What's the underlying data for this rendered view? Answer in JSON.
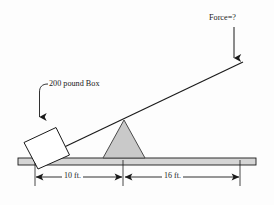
{
  "diagram": {
    "background_color": "#fdfdfd",
    "stroke_color": "#1a1a1a",
    "fill_gray": "#c9c9c9",
    "ground_fill": "#d5d5d5",
    "labels": {
      "force": "Force=?",
      "box": "200 pound Box",
      "distance_left": "10 ft.",
      "distance_right": "16 ft."
    },
    "elements": {
      "lever_label": "lever-arm",
      "fulcrum_label": "fulcrum-triangle",
      "ground_label": "ground-bar",
      "box_label": "weight-box",
      "force_arrow_label": "force-arrow",
      "box_leader_label": "box-leader-arrow"
    },
    "geometry": {
      "lever_left_x": 37,
      "lever_left_y": 160,
      "lever_right_x": 243,
      "lever_right_y": 62,
      "fulcrum_apex_x": 124,
      "fulcrum_apex_y": 120,
      "fulcrum_base_left_x": 103,
      "fulcrum_base_right_x": 145,
      "fulcrum_base_y": 158,
      "ground_top_y": 158,
      "ground_bottom_y": 165,
      "ground_left_x": 18,
      "ground_right_x": 256,
      "dim_line_y": 177,
      "dim_left_start_x": 35,
      "dim_center_x": 123,
      "dim_right_end_x": 240
    }
  }
}
